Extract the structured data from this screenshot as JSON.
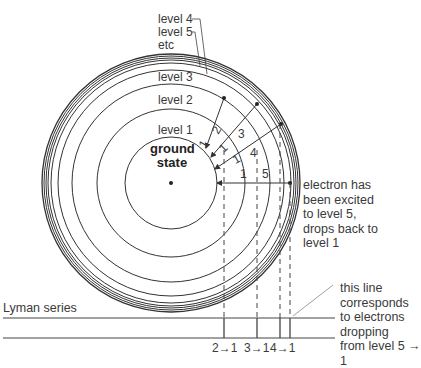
{
  "diagram": {
    "levels": [
      {
        "label": "level 1",
        "radius": 46
      },
      {
        "label": "level 2",
        "radius": 74
      },
      {
        "label": "level 3",
        "radius": 99
      },
      {
        "label": "level 4",
        "radius": 113
      },
      {
        "label": "level 5",
        "radius": 119
      }
    ],
    "level_labels": {
      "level4": "level 4",
      "level5": "level 5",
      "etc": "etc",
      "level3": "level 3",
      "level2": "level 2",
      "level1": "level 1"
    },
    "center_label_line1": "ground",
    "center_label_line2": "state",
    "transitions": [
      {
        "label": "1 ← 2",
        "from": 2,
        "to": 1
      },
      {
        "label": "1 ← 3",
        "from": 3,
        "to": 1
      },
      {
        "label": "1 ← 4",
        "from": 4,
        "to": 1
      },
      {
        "label": "1 ← 5",
        "from": 5,
        "to": 1
      }
    ],
    "transition_text": {
      "t2_from": "2",
      "t2_to": "1",
      "t3_from": "3",
      "t3_to": "1",
      "t4_from": "4",
      "t4_to": "1",
      "t5_from": "5",
      "t5_to": "1"
    },
    "annotation_excited": "electron has\nbeen excited\nto level 5,\ndrops back to\nlevel 1",
    "annotation_line": "this line\ncorresponds\nto electrons\ndropping\nfrom level 5 → 1",
    "series_label": "Lyman series",
    "spectrum_labels": [
      "2→1",
      "3→1",
      "4→1"
    ],
    "colors": {
      "line": "#333333",
      "text": "#3a3a3a",
      "background": "#ffffff"
    }
  }
}
